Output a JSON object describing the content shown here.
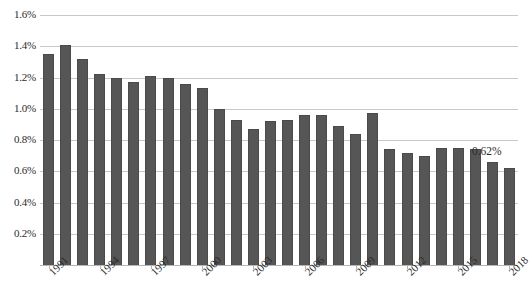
{
  "chart_data": {
    "type": "bar",
    "title": "",
    "subtitle": "",
    "xlabel": "",
    "ylabel": "",
    "categories": [
      "1991",
      "1992",
      "1993",
      "1994",
      "1995",
      "1996",
      "1997",
      "1998",
      "1999",
      "2000",
      "2001",
      "2002",
      "2003",
      "2004",
      "2005",
      "2006",
      "2007",
      "2008",
      "2009",
      "2010",
      "2011",
      "2012",
      "2013",
      "2014",
      "2015",
      "2016",
      "2017",
      "2018"
    ],
    "values": [
      1.35,
      1.41,
      1.32,
      1.22,
      1.2,
      1.17,
      1.21,
      1.2,
      1.16,
      1.13,
      1.0,
      0.93,
      0.87,
      0.92,
      0.93,
      0.96,
      0.96,
      0.89,
      0.84,
      0.97,
      0.74,
      0.72,
      0.7,
      0.75,
      0.75,
      0.74,
      0.66,
      0.62
    ],
    "ylim": [
      0.0,
      1.6
    ],
    "ytick_values": [
      1.6,
      1.4,
      1.2,
      1.0,
      0.8,
      0.6,
      0.4,
      0.2
    ],
    "ytick_labels": [
      "1.6%",
      "1.4%",
      "1.2%",
      "1.0%",
      "0.8%",
      "0.6%",
      "0.4%",
      "0.2%"
    ],
    "xtick_labels": [
      "1991",
      "1994",
      "1997",
      "2000",
      "2003",
      "2006",
      "2009",
      "2012",
      "2015",
      "2018"
    ],
    "xtick_indices": [
      0,
      3,
      6,
      9,
      12,
      15,
      18,
      21,
      24,
      27
    ],
    "annotations": [
      {
        "text": "0.62%",
        "category": "2018",
        "value": 0.62
      }
    ],
    "grid": true,
    "legend": false,
    "legend_position": "none",
    "series_name": "",
    "bar_color": "#565656",
    "grid_color": "#c9c9c9",
    "text_color": "#2b2b2b"
  }
}
